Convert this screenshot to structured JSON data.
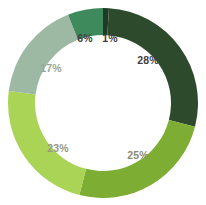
{
  "chart_data": {
    "type": "pie",
    "variant": "donut",
    "title": "",
    "subtitle": "",
    "xlabel": "",
    "ylabel": "",
    "grid": false,
    "legend": "none",
    "start_angle_deg": 0,
    "direction": "clockwise",
    "units": "percent",
    "total": 100,
    "labels_inside_ring": true,
    "categories": [
      "1%",
      "28%",
      "25%",
      "23%",
      "17%",
      "6%"
    ],
    "values": [
      1,
      28,
      25,
      23,
      17,
      6
    ],
    "slices": [
      {
        "name": "slice-1",
        "label": "1%",
        "value": 1,
        "color": "#1d3b25",
        "label_color": "#3f3f3f",
        "label_x": 110,
        "label_y": 38
      },
      {
        "name": "slice-2",
        "label": "28%",
        "value": 28,
        "color": "#2e4a2c",
        "label_color": "#3f3f3f",
        "label_x": 148,
        "label_y": 60
      },
      {
        "name": "slice-3",
        "label": "25%",
        "value": 25,
        "color": "#7dad33",
        "label_color": "#8d8d71",
        "label_x": 138,
        "label_y": 155
      },
      {
        "name": "slice-4",
        "label": "23%",
        "value": 23,
        "color": "#a9d martin",
        "label_color": "#9a9a80",
        "label_x": 58,
        "label_y": 148
      },
      {
        "name": "slice-5",
        "label": "17%",
        "value": 17,
        "color": "#9db9a4",
        "label_color": "#98a89b",
        "label_x": 51,
        "label_y": 68
      },
      {
        "name": "slice-6",
        "label": "6%",
        "value": 6,
        "color": "#3f8a5d",
        "label_color": "#3f3f3f",
        "label_x": 85,
        "label_y": 38
      }
    ],
    "colors": [
      "#1d3b25",
      "#2e4a2c",
      "#7dad33",
      "#a9d455",
      "#9db9a4",
      "#3f8a5d"
    ],
    "geometry": {
      "center_x": 103,
      "center_y": 103,
      "outer_radius": 95,
      "inner_radius": 68
    }
  }
}
